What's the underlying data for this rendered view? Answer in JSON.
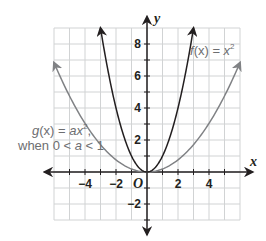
{
  "chart_data": {
    "type": "line",
    "title": "",
    "xlabel": "x",
    "ylabel": "y",
    "origin_label": "O",
    "xlim": [
      -6,
      6
    ],
    "ylim": [
      -3,
      9
    ],
    "grid": true,
    "x_ticks": [
      -4,
      -2,
      2,
      4
    ],
    "x_tick_labels": [
      "−4",
      "−2",
      "2",
      "4"
    ],
    "y_ticks": [
      -2,
      2,
      4,
      6,
      8
    ],
    "y_tick_labels": [
      "−2",
      "2",
      "4",
      "6",
      "8"
    ],
    "series": [
      {
        "name": "f(x) = x²",
        "equation": "x^2",
        "color": "#231f20",
        "x": [
          -3,
          -2,
          -1,
          0,
          1,
          2,
          3
        ],
        "y": [
          9,
          4,
          1,
          0,
          1,
          4,
          9
        ]
      },
      {
        "name": "g(x) = ax², when 0 < a < 1",
        "equation": "a*x^2 (a≈0.19)",
        "color": "#808285",
        "x": [
          -6,
          -4,
          -2,
          0,
          2,
          4,
          6
        ],
        "y": [
          6.9,
          3.0,
          0.8,
          0,
          0.8,
          3.0,
          6.9
        ]
      }
    ],
    "annotations": [
      {
        "text": "f(x) = x²",
        "position": "upper right near f curve"
      },
      {
        "text": "g(x) = ax²,",
        "line2": "when 0 < a < 1",
        "position": "left of g curve"
      }
    ]
  },
  "labels": {
    "x_axis": "x",
    "y_axis": "y",
    "origin": "O",
    "f_name": "f",
    "f_arg": "(x) = ",
    "f_var": "x",
    "f_exp": "2",
    "g_name": "g",
    "g_arg": "(x) = ",
    "g_var": "ax",
    "g_exp": "2",
    "g_comma": ",",
    "g_when": "when 0 < ",
    "g_a": "a",
    "g_lt1": " < 1"
  }
}
